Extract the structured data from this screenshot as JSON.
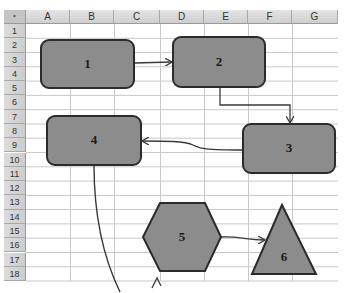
{
  "spreadsheet": {
    "corner_label": "•",
    "columns": [
      {
        "label": "A",
        "x": 26,
        "w": 44
      },
      {
        "label": "B",
        "x": 70,
        "w": 44
      },
      {
        "label": "C",
        "x": 114,
        "w": 46
      },
      {
        "label": "D",
        "x": 160,
        "w": 44
      },
      {
        "label": "E",
        "x": 204,
        "w": 44
      },
      {
        "label": "F",
        "x": 248,
        "w": 44
      },
      {
        "label": "G",
        "x": 292,
        "w": 46
      }
    ],
    "rows": [
      "1",
      "2",
      "3",
      "4",
      "5",
      "6",
      "7",
      "8",
      "9",
      "10",
      "11",
      "12",
      "13",
      "14",
      "15",
      "16",
      "17",
      "18"
    ],
    "row_top": 24,
    "row_height": 14.28
  },
  "shapes": [
    {
      "id": "1",
      "label": "1",
      "type": "rounded-rect"
    },
    {
      "id": "2",
      "label": "2",
      "type": "rounded-rect"
    },
    {
      "id": "3",
      "label": "3",
      "type": "rounded-rect"
    },
    {
      "id": "4",
      "label": "4",
      "type": "rounded-rect"
    },
    {
      "id": "5",
      "label": "5",
      "type": "hexagon"
    },
    {
      "id": "6",
      "label": "6",
      "type": "triangle"
    }
  ],
  "connectors": [
    {
      "from": "1",
      "to": "2",
      "style": "straight-arrow"
    },
    {
      "from": "2",
      "to": "3",
      "style": "elbow-arrow"
    },
    {
      "from": "3",
      "to": "4",
      "style": "curved-arrow"
    },
    {
      "from": "4",
      "to": "off-screen",
      "style": "curved-line"
    },
    {
      "from": "5",
      "to": "6",
      "style": "curved-arrow"
    }
  ],
  "colors": {
    "shape_fill": "#8c8c8c",
    "shape_border": "#2b2b2b",
    "grid_line": "#c8c8c8",
    "header_bg": "#d6d6d6",
    "connector": "#3a3a3a"
  }
}
